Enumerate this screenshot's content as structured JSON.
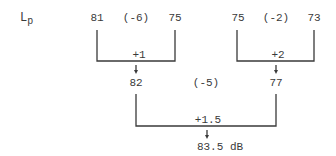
{
  "label": {
    "symbol": "L",
    "subscript": "p"
  },
  "top_row": {
    "left_pair": {
      "a": "81",
      "diff": "(-6)",
      "b": "75",
      "add": "+1",
      "result": "82"
    },
    "right_pair": {
      "a": "75",
      "diff": "(-2)",
      "b": "73",
      "add": "+2",
      "result": "77"
    }
  },
  "bottom_row": {
    "diff": "(-5)",
    "add": "+1.5",
    "result": "83.5 dB"
  },
  "colors": {
    "ink": "#3a3a3a",
    "background": "#ffffff"
  }
}
